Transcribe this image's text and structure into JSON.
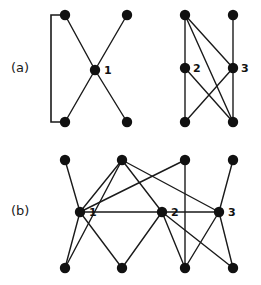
{
  "figure": {
    "type": "graph-diagram",
    "width": 261,
    "height": 285,
    "background_color": "#ffffff",
    "ink_color": "#1a1a1a",
    "node_color": "#111111",
    "node_radius": 5.2,
    "panels": [
      {
        "id": "a",
        "label": "(a)",
        "label_x": 11,
        "label_y": 60,
        "graphs": [
          {
            "id": "a-left",
            "name": "star-with-bracket",
            "nodes": [
              {
                "id": "a1-tl",
                "x": 65,
                "y": 15,
                "label": ""
              },
              {
                "id": "a1-tr",
                "x": 127,
                "y": 15,
                "label": ""
              },
              {
                "id": "a1-c",
                "x": 95,
                "y": 70,
                "label": "1",
                "label_dx": 9,
                "label_dy": 4
              },
              {
                "id": "a1-bl",
                "x": 65,
                "y": 122,
                "label": ""
              },
              {
                "id": "a1-br",
                "x": 127,
                "y": 122,
                "label": ""
              }
            ],
            "edges": [
              {
                "from": "a1-tl",
                "to": "a1-c"
              },
              {
                "from": "a1-tr",
                "to": "a1-c"
              },
              {
                "from": "a1-c",
                "to": "a1-bl"
              },
              {
                "from": "a1-c",
                "to": "a1-br"
              }
            ],
            "brackets": [
              {
                "id": "a1-bracket",
                "top_x": 65,
                "top_y": 15,
                "bottom_x": 65,
                "bottom_y": 122,
                "spine_x": 51
              }
            ]
          },
          {
            "id": "a-right",
            "name": "two-column-graph",
            "nodes": [
              {
                "id": "a2-tl",
                "x": 185,
                "y": 15,
                "label": ""
              },
              {
                "id": "a2-tr",
                "x": 233,
                "y": 15,
                "label": ""
              },
              {
                "id": "a2-ml",
                "x": 185,
                "y": 68,
                "label": "2",
                "label_dx": 8,
                "label_dy": 4
              },
              {
                "id": "a2-mr",
                "x": 233,
                "y": 68,
                "label": "3",
                "label_dx": 8,
                "label_dy": 4
              },
              {
                "id": "a2-bl",
                "x": 185,
                "y": 122,
                "label": ""
              },
              {
                "id": "a2-br",
                "x": 233,
                "y": 122,
                "label": ""
              }
            ],
            "edges": [
              {
                "from": "a2-tl",
                "to": "a2-ml"
              },
              {
                "from": "a2-tl",
                "to": "a2-mr"
              },
              {
                "from": "a2-tl",
                "to": "a2-br"
              },
              {
                "from": "a2-tr",
                "to": "a2-mr"
              },
              {
                "from": "a2-ml",
                "to": "a2-bl"
              },
              {
                "from": "a2-ml",
                "to": "a2-br"
              },
              {
                "from": "a2-mr",
                "to": "a2-bl"
              },
              {
                "from": "a2-mr",
                "to": "a2-br"
              }
            ],
            "brackets": []
          }
        ]
      },
      {
        "id": "b",
        "label": "(b)",
        "label_x": 11,
        "label_y": 203,
        "graphs": [
          {
            "id": "b-main",
            "name": "three-level-graph",
            "nodes": [
              {
                "id": "b-t1",
                "x": 65,
                "y": 160,
                "label": ""
              },
              {
                "id": "b-t2",
                "x": 122,
                "y": 160,
                "label": ""
              },
              {
                "id": "b-t3",
                "x": 185,
                "y": 160,
                "label": ""
              },
              {
                "id": "b-t4",
                "x": 233,
                "y": 160,
                "label": ""
              },
              {
                "id": "b-m1",
                "x": 80,
                "y": 212,
                "label": "1",
                "label_dx": 9,
                "label_dy": 4
              },
              {
                "id": "b-m2",
                "x": 162,
                "y": 212,
                "label": "2",
                "label_dx": 9,
                "label_dy": 4
              },
              {
                "id": "b-m3",
                "x": 219,
                "y": 212,
                "label": "3",
                "label_dx": 9,
                "label_dy": 4
              },
              {
                "id": "b-b1",
                "x": 65,
                "y": 268,
                "label": ""
              },
              {
                "id": "b-b2",
                "x": 122,
                "y": 268,
                "label": ""
              },
              {
                "id": "b-b3",
                "x": 185,
                "y": 268,
                "label": ""
              },
              {
                "id": "b-b4",
                "x": 233,
                "y": 268,
                "label": ""
              }
            ],
            "edges": [
              {
                "from": "b-t1",
                "to": "b-m1"
              },
              {
                "from": "b-t2",
                "to": "b-m1"
              },
              {
                "from": "b-t2",
                "to": "b-m2"
              },
              {
                "from": "b-t2",
                "to": "b-m3"
              },
              {
                "from": "b-t2",
                "to": "b-b1"
              },
              {
                "from": "b-t3",
                "to": "b-m1"
              },
              {
                "from": "b-t3",
                "to": "b-b3"
              },
              {
                "from": "b-t4",
                "to": "b-m3"
              },
              {
                "from": "b-m1",
                "to": "b-b1"
              },
              {
                "from": "b-m1",
                "to": "b-b2"
              },
              {
                "from": "b-m1",
                "to": "b-m3"
              },
              {
                "from": "b-m2",
                "to": "b-b2"
              },
              {
                "from": "b-m2",
                "to": "b-b3"
              },
              {
                "from": "b-m2",
                "to": "b-b4"
              },
              {
                "from": "b-m3",
                "to": "b-b3"
              },
              {
                "from": "b-m3",
                "to": "b-b4"
              }
            ],
            "brackets": []
          }
        ]
      }
    ]
  }
}
